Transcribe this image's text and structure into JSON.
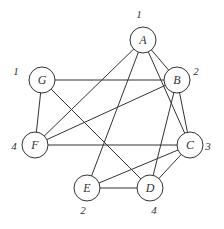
{
  "graph": {
    "nodes": [
      {
        "id": "A",
        "label": "A",
        "weight": "1",
        "x": 143,
        "y": 40,
        "wx": 139,
        "wy": 18
      },
      {
        "id": "B",
        "label": "B",
        "weight": "2",
        "x": 177,
        "y": 80,
        "wx": 196,
        "wy": 75
      },
      {
        "id": "C",
        "label": "C",
        "weight": "3",
        "x": 190,
        "y": 145,
        "wx": 208,
        "wy": 150
      },
      {
        "id": "D",
        "label": "D",
        "weight": "4",
        "x": 150,
        "y": 188,
        "wx": 154,
        "wy": 214
      },
      {
        "id": "E",
        "label": "E",
        "weight": "2",
        "x": 87,
        "y": 188,
        "wx": 83,
        "wy": 214
      },
      {
        "id": "F",
        "label": "F",
        "weight": "4",
        "x": 35,
        "y": 145,
        "wx": 14,
        "wy": 150
      },
      {
        "id": "G",
        "label": "G",
        "weight": "1",
        "x": 42,
        "y": 80,
        "wx": 16,
        "wy": 75
      }
    ],
    "edges": [
      [
        "A",
        "B"
      ],
      [
        "A",
        "C"
      ],
      [
        "A",
        "E"
      ],
      [
        "A",
        "F"
      ],
      [
        "G",
        "B"
      ],
      [
        "G",
        "F"
      ],
      [
        "G",
        "D"
      ],
      [
        "B",
        "F"
      ],
      [
        "B",
        "C"
      ],
      [
        "B",
        "D"
      ],
      [
        "F",
        "C"
      ],
      [
        "C",
        "E"
      ],
      [
        "C",
        "D"
      ],
      [
        "E",
        "D"
      ]
    ],
    "node_radius": 13
  }
}
